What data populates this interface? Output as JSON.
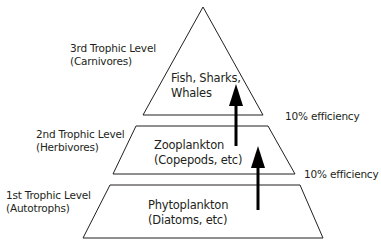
{
  "diagram": {
    "type": "trophic-pyramid",
    "levels": [
      {
        "side_label_line1": "3rd Trophic Level",
        "side_label_line2": "(Carnivores)",
        "content_line1": "Fish, Sharks,",
        "content_line2": "Whales"
      },
      {
        "side_label_line1": "2nd Trophic Level",
        "side_label_line2": "(Herbivores)",
        "content_line1": "Zooplankton",
        "content_line2": "(Copepods, etc)"
      },
      {
        "side_label_line1": "1st Trophic Level",
        "side_label_line2": "(Autotrophs)",
        "content_line1": "Phytoplankton",
        "content_line2": "(Diatoms, etc)"
      }
    ],
    "transfers": [
      {
        "label": "10% efficiency",
        "from": "2nd Trophic Level",
        "to": "3rd Trophic Level"
      },
      {
        "label": "10% efficiency",
        "from": "1st Trophic Level",
        "to": "2nd Trophic Level"
      }
    ],
    "colors": {
      "stroke": "#231f20",
      "fill": "#ffffff"
    }
  }
}
